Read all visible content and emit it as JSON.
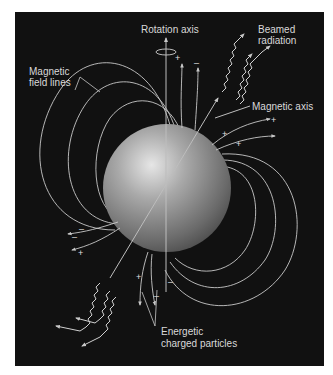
{
  "diagram": {
    "colors": {
      "background": "#111111",
      "page": "#ffffff",
      "lines": "#c8c8c8",
      "text": "#d9d9d9",
      "star_highlight": "#e8e8e8",
      "star_shadow": "#4a4a4a"
    },
    "labels": {
      "rotation_axis": "Rotation axis",
      "beamed_radiation_1": "Beamed",
      "beamed_radiation_2": "radiation",
      "magnetic_field_lines_1": "Magnetic",
      "magnetic_field_lines_2": "field lines",
      "magnetic_axis": "Magnetic axis",
      "energetic_particles_1": "Energetic",
      "energetic_particles_2": "charged particles"
    },
    "charges": {
      "plus": "+",
      "minus": "–"
    }
  }
}
